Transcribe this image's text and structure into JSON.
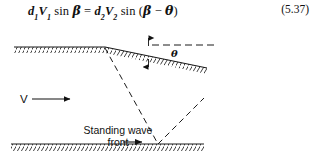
{
  "figure": {
    "equation": {
      "lhs_d": "d",
      "lhs_d_sub": "1",
      "lhs_v": "V",
      "lhs_v_sub": "1",
      "sin": "sin",
      "beta": "β",
      "equals": "=",
      "rhs_d": "d",
      "rhs_d_sub": "2",
      "rhs_v": "V",
      "rhs_v_sub": "2",
      "open_paren": "(",
      "minus": "−",
      "theta": "θ",
      "close_paren": ")",
      "plain_text": "d1V1 sin β = d2V2 sin (β − θ)",
      "number": "(5.37)"
    },
    "labels": {
      "velocity": "V",
      "standing_wave_line1": "Standing wave",
      "standing_wave_line2": "front",
      "dip_angle": "θ"
    },
    "colors": {
      "ink": "#111111",
      "line": "#1a1a1a",
      "hatch": "#2b2b2b",
      "background": "#ffffff"
    },
    "geometry": {
      "top_surface_flat": "x 14 to 105 at y 21",
      "top_surface_slope": "x 105 to 207, y 21 to 42",
      "bottom_surface": "x 11 to 204 at y 118",
      "incident_ray": "from 105,22 to 158,118",
      "reflected_ray": "from 158,118 to 204,73",
      "reference_dash_line": "x 152 to 215 at y 19"
    }
  }
}
